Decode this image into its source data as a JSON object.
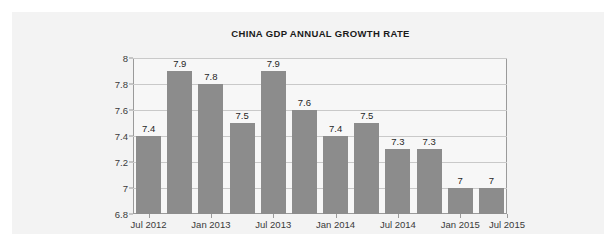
{
  "panel": {
    "background_color": "#f3f3f3"
  },
  "chart_data": {
    "type": "bar",
    "title": "CHINA GDP ANNUAL GROWTH RATE",
    "xlabel": "",
    "ylabel": "",
    "ylim": [
      6.8,
      8
    ],
    "yticks": [
      "8",
      "7.8",
      "7.6",
      "7.4",
      "7.2",
      "7",
      "6.8"
    ],
    "ytick_values": [
      8,
      7.8,
      7.6,
      7.4,
      7.2,
      7,
      6.8
    ],
    "grid": true,
    "legend": false,
    "bar_color": "#8c8c8c",
    "values": [
      7.4,
      7.9,
      7.8,
      7.5,
      7.9,
      7.6,
      7.4,
      7.5,
      7.3,
      7.3,
      7,
      7
    ],
    "data_labels": [
      "7.4",
      "7.9",
      "7.8",
      "7.5",
      "7.9",
      "7.6",
      "7.4",
      "7.5",
      "7.3",
      "7.3",
      "7",
      "7"
    ],
    "categories": [
      "Jul 2012",
      "Oct 2012",
      "Jan 2013",
      "Apr 2013",
      "Jul 2013",
      "Oct 2013",
      "Jan 2014",
      "Apr 2014",
      "Jul 2014",
      "Oct 2014",
      "Jan 2015",
      "Apr 2015"
    ],
    "xtick_labels": [
      "Jul 2012",
      "Jan 2013",
      "Jul 2013",
      "Jan 2014",
      "Jul 2014",
      "Jan 2015",
      "Jul 2015"
    ],
    "xtick_bar_index": [
      0,
      2,
      4,
      6,
      8,
      10,
      12
    ]
  }
}
